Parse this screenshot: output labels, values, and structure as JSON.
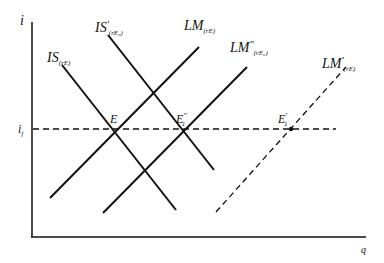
{
  "diagram": {
    "axes": {
      "y_label": "i",
      "x_label": "q",
      "reference_line_label": "i",
      "reference_line_sub": "f"
    },
    "curves": [
      {
        "id": "IS",
        "name": "IS",
        "prime": "",
        "sub": "(rE)",
        "style": "solid"
      },
      {
        "id": "IS_prime",
        "name": "IS",
        "prime": "'",
        "sub": "(rE₀)",
        "style": "solid"
      },
      {
        "id": "LM",
        "name": "LM",
        "prime": "",
        "sub": "(rE)",
        "style": "solid"
      },
      {
        "id": "LM_double_prime",
        "name": "LM",
        "prime": "''",
        "sub": "(rE₀)",
        "style": "solid"
      },
      {
        "id": "LM_prime",
        "name": "LM",
        "prime": "'",
        "sub": "(rE)",
        "style": "dashed"
      }
    ],
    "points": [
      {
        "id": "E",
        "label": "E",
        "sub": "",
        "prime": ""
      },
      {
        "id": "E1_double_prime",
        "label": "E",
        "sub": "1",
        "prime": "''"
      },
      {
        "id": "E1_prime",
        "label": "E",
        "sub": "1",
        "prime": "'"
      }
    ]
  }
}
